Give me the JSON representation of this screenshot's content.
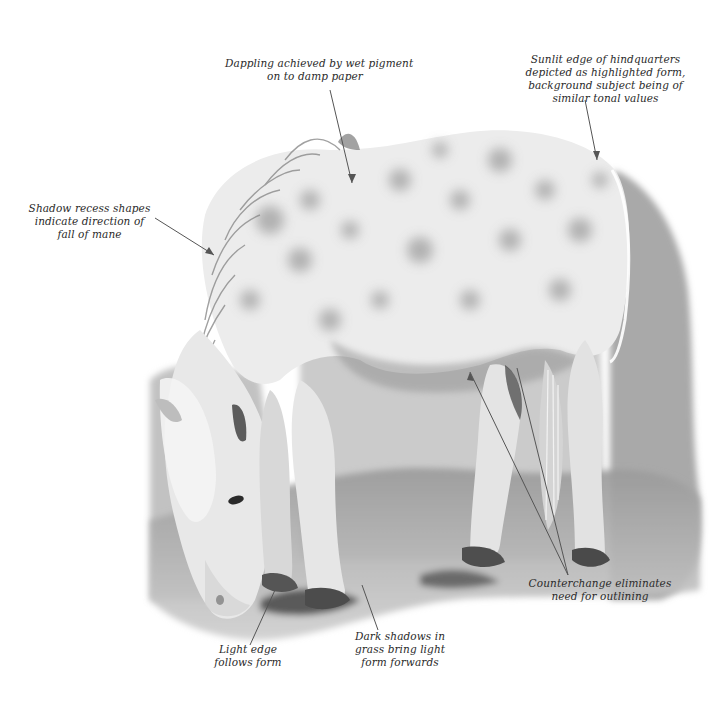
{
  "figure": {
    "palette": {
      "paper": "#ffffff",
      "light_wash": "#e4e4e4",
      "mid_wash": "#b8b8b8",
      "dark_wash": "#6e6e6e",
      "deep_shadow": "#2e2e2e",
      "text": "#2a2a2a",
      "leader_line": "#555555"
    }
  },
  "annotations": [
    {
      "id": "dappling",
      "lines": [
        "Dappling achieved by wet pigment",
        "on to damp paper"
      ]
    },
    {
      "id": "sunlit-edge",
      "lines": [
        "Sunlit edge of hindquarters",
        "depicted as highlighted form,",
        "background subject being of",
        "similar tonal values"
      ]
    },
    {
      "id": "shadow-recess",
      "lines": [
        "Shadow recess shapes",
        "indicate direction of",
        "fall of mane"
      ]
    },
    {
      "id": "light-edge",
      "lines": [
        "Light edge",
        "follows form"
      ]
    },
    {
      "id": "dark-shadows",
      "lines": [
        "Dark shadows in",
        "grass bring light",
        "form forwards"
      ]
    },
    {
      "id": "counterchange",
      "lines": [
        "Counterchange eliminates",
        "need for outlining"
      ]
    }
  ]
}
